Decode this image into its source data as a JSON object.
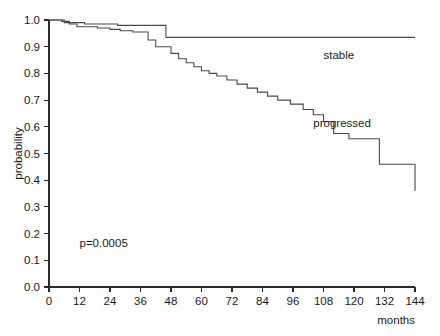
{
  "chart_data": {
    "type": "line",
    "title": "",
    "xlabel": "months",
    "ylabel": "probability",
    "xlim": [
      0,
      144
    ],
    "ylim": [
      0,
      1.0
    ],
    "grid": false,
    "legend_position": "inline-right",
    "xticks": [
      0,
      12,
      24,
      36,
      48,
      60,
      72,
      84,
      96,
      108,
      120,
      132,
      144
    ],
    "xticklabels": [
      "0",
      "12",
      "24",
      "36",
      "48",
      "60",
      "72",
      "84",
      "96",
      "108",
      "120",
      "132",
      "144"
    ],
    "yticks": [
      0.0,
      0.1,
      0.2,
      0.3,
      0.4,
      0.5,
      0.6,
      0.7,
      0.8,
      0.9,
      1.0
    ],
    "yticklabels": [
      "0.0",
      "0.1",
      "0.2",
      "0.3",
      "0.4",
      "0.5",
      "0.6",
      "0.7",
      "0.8",
      "0.9",
      "1.0"
    ],
    "annotations": [
      {
        "text": "p=0.0005",
        "x": 12,
        "y": 0.15
      }
    ],
    "series": [
      {
        "name": "stable",
        "label": "stable",
        "label_x": 108,
        "label_y": 0.855,
        "step": "post",
        "x": [
          0,
          3,
          6,
          9,
          14,
          20,
          27,
          46,
          144
        ],
        "y": [
          1.0,
          1.0,
          0.99,
          0.99,
          0.985,
          0.985,
          0.98,
          0.935,
          0.935
        ]
      },
      {
        "name": "progressed",
        "label": "progressed",
        "label_x": 104,
        "label_y": 0.6,
        "step": "post",
        "x": [
          0,
          2,
          5,
          8,
          11,
          15,
          19,
          24,
          28,
          33,
          36,
          39,
          42,
          45,
          48,
          51,
          54,
          57,
          60,
          63,
          66,
          70,
          74,
          78,
          82,
          86,
          90,
          95,
          100,
          104,
          108,
          112,
          118,
          124,
          130,
          144
        ],
        "y": [
          1.0,
          1.0,
          0.995,
          0.985,
          0.975,
          0.975,
          0.97,
          0.965,
          0.96,
          0.955,
          0.955,
          0.925,
          0.9,
          0.9,
          0.875,
          0.855,
          0.84,
          0.825,
          0.81,
          0.8,
          0.79,
          0.775,
          0.76,
          0.745,
          0.73,
          0.715,
          0.7,
          0.685,
          0.665,
          0.645,
          0.62,
          0.575,
          0.555,
          0.555,
          0.46,
          0.36
        ]
      }
    ]
  }
}
